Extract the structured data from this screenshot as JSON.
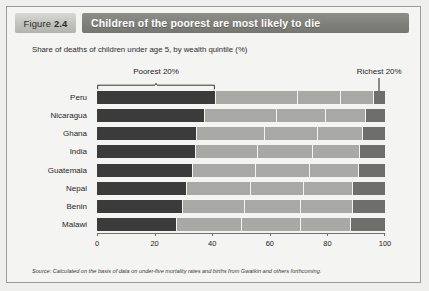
{
  "figure": {
    "number_prefix": "Figure",
    "number": "2.4",
    "title": "Children of the poorest are most likely to die",
    "subtitle": "Share of deaths of children under age 5, by wealth quintile (%)",
    "source": "Source: Calculated on the basis of data on under-five mortality rates and births from Gwatkin and others forthcoming."
  },
  "annotations": {
    "poorest_label": "Poorest 20%",
    "richest_label": "Richest 20%"
  },
  "colors": {
    "quintile_1": "#3b3b3b",
    "quintile_2": "#a8a8a4",
    "quintile_3": "#a8a8a4",
    "quintile_4": "#a8a8a4",
    "quintile_5": "#6e6e6a",
    "title_bar": "#7e7e79",
    "figure_box": "#c2c2bd",
    "card_background": "#f4f4f2",
    "border": "#9a9a96"
  },
  "chart_data": {
    "type": "bar",
    "orientation": "horizontal",
    "stacked": true,
    "title": "Children of the poorest are most likely to die",
    "subtitle": "Share of deaths of children under age 5, by wealth quintile (%)",
    "xlabel": "",
    "ylabel": "",
    "xlim": [
      0,
      100
    ],
    "xticks": [
      0,
      20,
      40,
      60,
      80,
      100
    ],
    "xtick_labels": [
      "0",
      "20",
      "40",
      "60",
      "80",
      "100"
    ],
    "grid": false,
    "legend": "none",
    "categories": [
      "Peru",
      "Nicaragua",
      "Ghana",
      "India",
      "Guatemala",
      "Nepal",
      "Benin",
      "Malawi"
    ],
    "series": [
      {
        "name": "Poorest 20%",
        "color": "#3b3b3b",
        "values": [
          41.0,
          37.0,
          34.5,
          34.0,
          33.0,
          31.0,
          29.5,
          27.5
        ]
      },
      {
        "name": "Second 20%",
        "color": "#a8a8a4",
        "values": [
          28.5,
          25.0,
          23.5,
          21.5,
          22.0,
          22.0,
          21.5,
          22.5
        ]
      },
      {
        "name": "Middle 20%",
        "color": "#a8a8a4",
        "values": [
          15.0,
          17.0,
          18.5,
          19.0,
          18.5,
          18.5,
          19.5,
          20.5
        ]
      },
      {
        "name": "Fourth 20%",
        "color": "#a8a8a4",
        "values": [
          11.5,
          14.0,
          15.5,
          16.5,
          17.0,
          17.0,
          18.0,
          17.5
        ]
      },
      {
        "name": "Richest 20%",
        "color": "#6e6e6a",
        "values": [
          4.0,
          7.0,
          8.0,
          9.0,
          9.5,
          11.5,
          11.5,
          12.0
        ]
      }
    ]
  }
}
